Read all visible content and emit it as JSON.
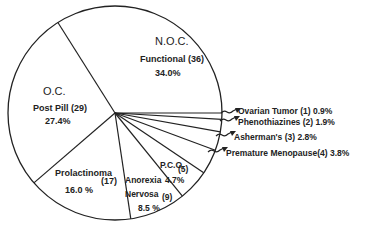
{
  "chart_data": {
    "type": "pie",
    "title": "",
    "total_n": 106,
    "center": [
      115,
      113
    ],
    "radius": 107,
    "start_angle_deg": 0,
    "direction": "counterclockwise",
    "slices": [
      {
        "group": "N.O.C.",
        "label": "Functional",
        "count": 36,
        "percent": 34.0,
        "count_text": "Functional (36)",
        "pct_text": "34.0%"
      },
      {
        "group": "O.C.",
        "label": "Post Pill",
        "count": 29,
        "percent": 27.4,
        "count_text": "Post Pill (29)",
        "pct_text": "27.4%"
      },
      {
        "group": "",
        "label": "Prolactinoma",
        "count": 17,
        "percent": 16.0,
        "count_text": "(17)",
        "pct_text": "16.0 %"
      },
      {
        "group": "",
        "label": "Anorexia Nervosa",
        "count": 9,
        "percent": 8.5,
        "count_text": "(9)",
        "pct_text": "8.5 %"
      },
      {
        "group": "",
        "label": "P.C.O.",
        "count": 5,
        "percent": 4.7,
        "count_text": "(5)",
        "pct_text": "4.7%"
      },
      {
        "group": "",
        "label": "Premature Menopause",
        "count": 4,
        "percent": 3.8,
        "count_text": "(4)",
        "pct_text": "3.8%"
      },
      {
        "group": "",
        "label": "Asherman's",
        "count": 3,
        "percent": 2.8,
        "count_text": "(3)",
        "pct_text": "2.8%"
      },
      {
        "group": "",
        "label": "Phenothiazines",
        "count": 2,
        "percent": 1.9,
        "count_text": "(2)",
        "pct_text": "1.9%"
      },
      {
        "group": "",
        "label": "Ovarian Tumor",
        "count": 1,
        "percent": 0.9,
        "count_text": "(1)",
        "pct_text": "0.9%"
      }
    ]
  },
  "labels": {
    "noc_group": "N.O.C.",
    "noc_line": "Functional (36)",
    "noc_pct": "34.0%",
    "oc_group": "O.C.",
    "oc_line": "Post Pill (29)",
    "oc_pct": "27.4%",
    "prolactinoma_name": "Prolactinoma",
    "prolactinoma_count": "(17)",
    "prolactinoma_pct": "16.0 %",
    "anorexia_line1": "Anorexia",
    "anorexia_line2": "Nervosa",
    "anorexia_count": "(9)",
    "anorexia_pct": "8.5 %",
    "pco_name": "P.C.O.",
    "pco_count": "(5)",
    "pco_pct": "4.7%",
    "ovarian": "Ovarian Tumor (1) 0.9%",
    "phenothiazines": "Phenothiazines (2) 1.9%",
    "ashermans": "Asherman's (3) 2.8%",
    "premature": "Premature  Menopause(4) 3.8%"
  }
}
